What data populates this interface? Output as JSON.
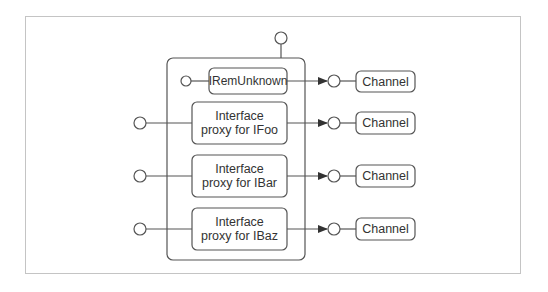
{
  "diagram": {
    "type": "component-diagram",
    "colors": {
      "stroke": "#555555",
      "frame": "#c4c4c4",
      "text": "#333333",
      "background": "#ffffff"
    },
    "container": {
      "label": ""
    },
    "top_interface": {
      "shape": "lollipop"
    },
    "components": [
      {
        "id": "iremunknown",
        "label": "IRemUnknown",
        "left_interface": "small-lollipop",
        "channel": "Channel"
      },
      {
        "id": "ifoo",
        "line1": "Interface",
        "line2": "proxy for IFoo",
        "left_interface": "lollipop",
        "channel": "Channel"
      },
      {
        "id": "ibar",
        "line1": "Interface",
        "line2": "proxy for IBar",
        "left_interface": "lollipop",
        "channel": "Channel"
      },
      {
        "id": "ibaz",
        "line1": "Interface",
        "line2": "proxy for IBaz",
        "left_interface": "lollipop",
        "channel": "Channel"
      }
    ]
  }
}
